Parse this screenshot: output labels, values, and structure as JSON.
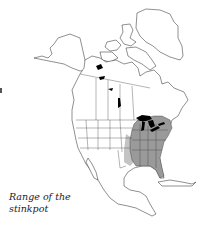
{
  "figure": {
    "type": "range map",
    "region": "North America",
    "caption_line1": "Range of the",
    "caption_line2": "stinkpot",
    "species": "stinkpot"
  },
  "legend": {
    "range_fill_color": "#9a9a9a",
    "range_edge_color": "#c4c4c4",
    "lakes_color": "#000000",
    "land_color": "#ffffff",
    "outline_color": "#333333"
  },
  "range": {
    "description": "Eastern United States from the Great Lakes and southern Ontario south to Florida and the Gulf Coast, west to central Texas",
    "shaded_regions": [
      "Eastern United States",
      "Southern Ontario",
      "Gulf Coast",
      "Florida"
    ]
  }
}
